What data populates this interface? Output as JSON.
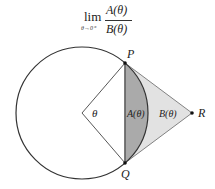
{
  "formula": {
    "lim": "lim",
    "subscript": "θ→0⁺",
    "numerator": "A(θ)",
    "denominator": "B(θ)"
  },
  "diagram": {
    "center": {
      "x": 82,
      "y": 113
    },
    "radius": 66,
    "points": {
      "P": {
        "label": "P",
        "x": 125,
        "y": 63
      },
      "Q": {
        "label": "Q",
        "x": 125,
        "y": 163
      },
      "R": {
        "label": "R",
        "x": 192,
        "y": 113
      }
    },
    "angle_label": "θ",
    "region_A_label": "A(θ)",
    "region_B_label": "B(θ)",
    "colors": {
      "circle_stroke": "#333333",
      "segment_fill": "#aaaaaa",
      "triangle_fill": "#e2e2e2",
      "line_stroke": "#444444"
    }
  }
}
